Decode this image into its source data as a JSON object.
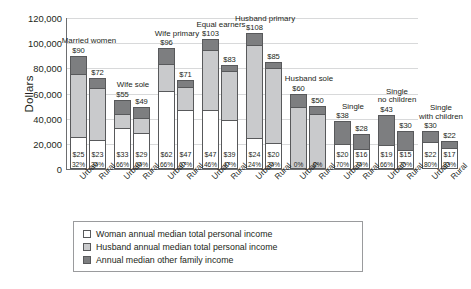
{
  "chart_data": {
    "type": "bar",
    "stacked": true,
    "title": "",
    "xlabel": "",
    "ylabel": "Dollars",
    "ylim": [
      0,
      120000
    ],
    "ytick_labels": [
      "0",
      "20,000",
      "40,000",
      "60,000",
      "80,000",
      "100,000",
      "120,000"
    ],
    "ytick_values": [
      0,
      20000,
      40000,
      60000,
      80000,
      100000,
      120000
    ],
    "grid": true,
    "legend_position": "bottom",
    "legend": [
      "Woman annual median total personal income",
      "Husband annual median total personal income",
      "Annual median other family income"
    ],
    "series": [
      {
        "name": "Woman annual median total personal income",
        "color": "#ffffff"
      },
      {
        "name": "Husband annual median total personal income",
        "color": "#c9cacc"
      },
      {
        "name": "Annual median other family income",
        "color": "#7d7e80"
      }
    ],
    "categories": [
      "Urban",
      "Rural"
    ],
    "groups": [
      {
        "caption": "Married women",
        "bars": [
          {
            "tick": "Urban",
            "total_label": "$90",
            "total": 90000,
            "woman_label": "$25",
            "woman": 25000,
            "husband": 51000,
            "other": 14000,
            "pct": "32%"
          },
          {
            "tick": "Rural",
            "total_label": "$72",
            "total": 72000,
            "woman_label": "$23",
            "woman": 23000,
            "husband": 42000,
            "other": 7000,
            "pct": "34%"
          }
        ]
      },
      {
        "caption": "Wife sole",
        "bars": [
          {
            "tick": "Urban",
            "total_label": "$55",
            "total": 55000,
            "woman_label": "$33",
            "woman": 33000,
            "husband": 11000,
            "other": 11000,
            "pct": "66%"
          },
          {
            "tick": "Rural",
            "total_label": "$49",
            "total": 49000,
            "woman_label": "$29",
            "woman": 29000,
            "husband": 12000,
            "other": 8000,
            "pct": "64%"
          }
        ]
      },
      {
        "caption": "Wife primary",
        "bars": [
          {
            "tick": "Urban",
            "total_label": "$96",
            "total": 96000,
            "woman_label": "$62",
            "woman": 62000,
            "husband": 22000,
            "other": 12000,
            "pct": "66%"
          },
          {
            "tick": "Rural",
            "total_label": "$71",
            "total": 71000,
            "woman_label": "$47",
            "woman": 47000,
            "husband": 19000,
            "other": 5000,
            "pct": "67%"
          }
        ]
      },
      {
        "caption": "Equal earners",
        "bars": [
          {
            "tick": "Urban",
            "total_label": "$103",
            "total": 103000,
            "woman_label": "$47",
            "woman": 47000,
            "husband": 48000,
            "other": 8000,
            "pct": "46%"
          },
          {
            "tick": "Rural",
            "total_label": "$83",
            "total": 83000,
            "woman_label": "$39",
            "woman": 39000,
            "husband": 40000,
            "other": 4000,
            "pct": "47%"
          }
        ]
      },
      {
        "caption": "Husband primary",
        "bars": [
          {
            "tick": "Urban",
            "total_label": "$108",
            "total": 108000,
            "woman_label": "$24",
            "woman": 24000,
            "husband": 75000,
            "other": 9000,
            "pct": "24%"
          },
          {
            "tick": "Rural",
            "total_label": "$85",
            "total": 85000,
            "woman_label": "$20",
            "woman": 20000,
            "husband": 61000,
            "other": 4000,
            "pct": "24%"
          }
        ]
      },
      {
        "caption": "Husband sole",
        "bars": [
          {
            "tick": "Urban",
            "total_label": "$60",
            "total": 60000,
            "woman_label": "",
            "woman": 0,
            "husband": 50000,
            "other": 10000,
            "pct": "0%"
          },
          {
            "tick": "Rural",
            "total_label": "$50",
            "total": 50000,
            "woman_label": "",
            "woman": 0,
            "husband": 44000,
            "other": 6000,
            "pct": "0%"
          }
        ]
      },
      {
        "caption": "Single",
        "bars": [
          {
            "tick": "Urban",
            "total_label": "$38",
            "total": 38000,
            "woman_label": "$20",
            "woman": 20000,
            "husband": 0,
            "other": 18000,
            "pct": "70%"
          },
          {
            "tick": "Rural",
            "total_label": "$28",
            "total": 28000,
            "woman_label": "$16",
            "woman": 16000,
            "husband": 0,
            "other": 12000,
            "pct": "74%"
          }
        ]
      },
      {
        "caption": "Single\nno children",
        "bars": [
          {
            "tick": "Urban",
            "total_label": "$43",
            "total": 43000,
            "woman_label": "$19",
            "woman": 19000,
            "husband": 0,
            "other": 24000,
            "pct": "66%"
          },
          {
            "tick": "Rural",
            "total_label": "$30",
            "total": 30000,
            "woman_label": "$15",
            "woman": 15000,
            "husband": 0,
            "other": 15000,
            "pct": "70%"
          }
        ]
      },
      {
        "caption": "Single\nwith children",
        "bars": [
          {
            "tick": "Urban",
            "total_label": "$30",
            "total": 30000,
            "woman_label": "$22",
            "woman": 22000,
            "husband": 0,
            "other": 8000,
            "pct": "80%"
          },
          {
            "tick": "Rural",
            "total_label": "$22",
            "total": 22000,
            "woman_label": "$17",
            "woman": 17000,
            "husband": 0,
            "other": 5000,
            "pct": "83%"
          }
        ]
      }
    ]
  }
}
